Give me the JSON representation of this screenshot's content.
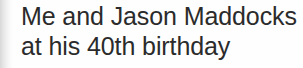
{
  "image": {
    "kind": "scanned-photo-caption",
    "width": 303,
    "height": 68,
    "background_color": "#fefefe",
    "text_color": "#2b2b2b",
    "edge_shadow_color": "#d8d8d8"
  },
  "caption": {
    "full_text": "Me and Jason Maddocks at his 40th birthday",
    "lines": [
      {
        "text": "Me and Jason Maddocks"
      },
      {
        "text": "at his 40th birthday"
      }
    ]
  }
}
